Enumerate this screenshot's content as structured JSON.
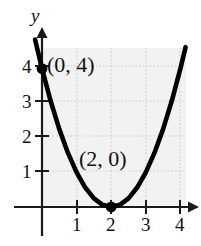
{
  "chart_data": {
    "type": "line",
    "title": "",
    "subtitle": "",
    "xlabel": "",
    "ylabel": "y",
    "function": "y = (x - 2)^2",
    "xlim": [
      -0.35,
      4.4
    ],
    "ylim": [
      -0.5,
      4.6
    ],
    "grid": true,
    "grid_style": "dotted",
    "grid_color": "#c9c9c9",
    "plot_bg_color": "#f2f2f2",
    "axis_color": "#1a1a1a",
    "curve_color": "#000000",
    "legend": null,
    "x_ticks": [
      1,
      2,
      3,
      4
    ],
    "x_tick_labels": [
      "1",
      "2",
      "3",
      "4"
    ],
    "y_ticks": [
      1,
      2,
      3,
      4
    ],
    "y_tick_labels": [
      "1",
      "2",
      "3",
      "4"
    ],
    "series": [
      {
        "name": "parabola",
        "points": [
          [
            -0.2,
            4.84
          ],
          [
            0,
            4
          ],
          [
            0.25,
            3.0625
          ],
          [
            0.5,
            2.25
          ],
          [
            0.75,
            1.5625
          ],
          [
            1,
            1
          ],
          [
            1.25,
            0.5625
          ],
          [
            1.5,
            0.25
          ],
          [
            1.75,
            0.0625
          ],
          [
            2,
            0
          ],
          [
            2.25,
            0.0625
          ],
          [
            2.5,
            0.25
          ],
          [
            2.75,
            0.5625
          ],
          [
            3,
            1
          ],
          [
            3.25,
            1.5625
          ],
          [
            3.5,
            2.25
          ],
          [
            3.75,
            3.0625
          ],
          [
            4,
            4
          ],
          [
            4.15,
            4.62
          ]
        ]
      }
    ],
    "marked_points": [
      {
        "x": 0,
        "y": 4,
        "label": "(0, 4)"
      },
      {
        "x": 2,
        "y": 0,
        "label": "(2, 0)"
      }
    ],
    "annotations": [
      {
        "text": "(0, 4)",
        "x": 0,
        "y": 4
      },
      {
        "text": "(2, 0)",
        "x": 1.4,
        "y": 1.25
      },
      {
        "text": "y",
        "x": 0,
        "y": 5.1
      }
    ]
  }
}
